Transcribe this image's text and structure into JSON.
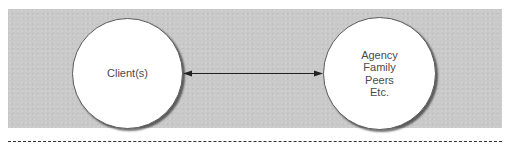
{
  "diagram": {
    "type": "relationship",
    "background_panel_color": "#c9c9c9",
    "nodes": [
      {
        "id": "client",
        "label": "Client(s)",
        "shape": "circle",
        "fill": "#ffffff"
      },
      {
        "id": "others",
        "label": "Agency\nFamily\nPeers\nEtc.",
        "lines": [
          "Agency",
          "Family",
          "Peers",
          "Etc."
        ],
        "shape": "circle",
        "fill": "#ffffff"
      }
    ],
    "edges": [
      {
        "from": "client",
        "to": "others",
        "direction": "bidirectional",
        "style": "solid",
        "color": "#222222"
      }
    ],
    "footer_divider": {
      "style": "dashed",
      "color": "#333333"
    }
  }
}
